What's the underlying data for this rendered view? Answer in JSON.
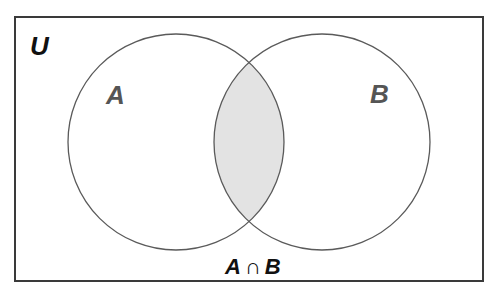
{
  "diagram": {
    "type": "venn",
    "universe_label": "U",
    "sets": [
      {
        "label": "A"
      },
      {
        "label": "B"
      }
    ],
    "highlight_label": "A ∩ B",
    "highlight_parts": {
      "left": "A",
      "op": "∩",
      "right": "B"
    },
    "colors": {
      "stroke": "#5a5a5a",
      "frame": "#3a3a3a",
      "fill": "#e3e3e3",
      "universe_text": "#111111",
      "set_text": "#555555",
      "highlight_text": "#111111"
    }
  }
}
